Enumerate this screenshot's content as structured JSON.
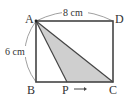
{
  "diagram": {
    "type": "geometry-rectangle",
    "points": {
      "A": {
        "label": "A",
        "x": 36,
        "y": 21
      },
      "B": {
        "label": "B",
        "x": 36,
        "y": 82
      },
      "C": {
        "label": "C",
        "x": 113,
        "y": 82
      },
      "D": {
        "label": "D",
        "x": 113,
        "y": 21
      },
      "P": {
        "label": "P",
        "x": 67,
        "y": 82
      }
    },
    "dimensions": {
      "top": "8 cm",
      "left": "6 cm"
    },
    "shaded_region": [
      "A",
      "P",
      "C"
    ],
    "colors": {
      "stroke": "#444444",
      "shade": "#cfcfcf",
      "arc": "#777777"
    },
    "motion_arrow": "→"
  }
}
